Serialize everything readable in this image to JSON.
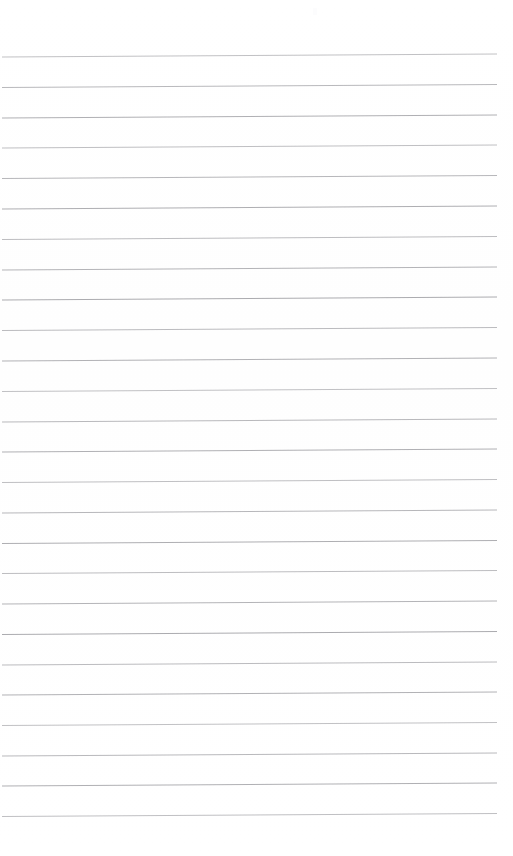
{
  "document": {
    "kind": "scanned-lined-notebook-page",
    "title": "Blank lined paper",
    "page_width": 513,
    "page_height": 856,
    "background_color": "#ffffff",
    "content_text": "",
    "has_handwriting": false,
    "has_printed_text": false
  },
  "ruling": {
    "line_color": "#9a9a9e",
    "line_width_px": 0.85,
    "line_count": 26,
    "line_spacing_px": 30.3,
    "first_line_y": 56,
    "last_line_y": 814,
    "left_margin_x": 2,
    "right_margin_x": 497,
    "tilt_rise_px": 3,
    "tilt_description": "lines rise slightly toward the right edge",
    "line_y_left": [
      57,
      87.5,
      118,
      148,
      178.5,
      209,
      239.5,
      270,
      300,
      330.5,
      361,
      391.5,
      422,
      452,
      482.5,
      513,
      543.5,
      573.5,
      604,
      634.5,
      665,
      695,
      725.5,
      756,
      786,
      816.5
    ],
    "line_y_right": [
      54,
      84.5,
      115,
      145,
      175.5,
      206,
      236.5,
      267,
      297,
      327.5,
      358,
      388.5,
      419,
      449,
      479.5,
      510,
      540.5,
      570.5,
      601,
      631.5,
      662,
      692,
      722.5,
      753,
      783,
      813.5
    ]
  },
  "artifacts": {
    "speck": {
      "x": 313,
      "y": 8,
      "note": "faint scan speck near top margin"
    }
  }
}
